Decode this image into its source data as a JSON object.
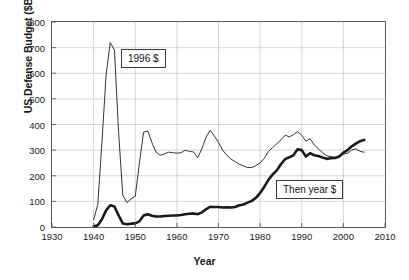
{
  "chart_data": {
    "type": "line",
    "title": "",
    "xlabel": "Year",
    "ylabel": "US Defense Budget ($B)",
    "xlim": [
      1930,
      2010
    ],
    "ylim": [
      0,
      800
    ],
    "xticks": [
      1930,
      1940,
      1950,
      1960,
      1970,
      1980,
      1990,
      2000,
      2010
    ],
    "yticks": [
      0,
      100,
      200,
      300,
      400,
      500,
      600,
      700,
      800
    ],
    "grid": true,
    "legend_position": "inline-annotations",
    "annotations": [
      {
        "text": "1996 $",
        "series": "constant_1996_dollars",
        "x": 1947,
        "y": 640
      },
      {
        "text": "Then year $",
        "series": "then_year_dollars",
        "x": 1985,
        "y": 150
      }
    ],
    "series": [
      {
        "name": "1996 $",
        "style": "thin",
        "color": "#333333",
        "x": [
          1940,
          1941,
          1942,
          1943,
          1944,
          1945,
          1946,
          1947,
          1948,
          1949,
          1950,
          1951,
          1952,
          1953,
          1954,
          1955,
          1956,
          1957,
          1958,
          1959,
          1960,
          1961,
          1962,
          1963,
          1964,
          1965,
          1966,
          1967,
          1968,
          1969,
          1970,
          1971,
          1972,
          1973,
          1974,
          1975,
          1976,
          1977,
          1978,
          1979,
          1980,
          1981,
          1982,
          1983,
          1984,
          1985,
          1986,
          1987,
          1988,
          1989,
          1990,
          1991,
          1992,
          1993,
          1994,
          1995,
          1996,
          1997,
          1998,
          1999,
          2000,
          2001,
          2002,
          2003,
          2004,
          2005
        ],
        "values": [
          28,
          88,
          330,
          595,
          720,
          690,
          370,
          125,
          95,
          110,
          120,
          250,
          370,
          375,
          330,
          292,
          280,
          285,
          292,
          290,
          288,
          290,
          300,
          295,
          293,
          270,
          305,
          350,
          378,
          355,
          330,
          300,
          280,
          265,
          255,
          245,
          238,
          232,
          232,
          240,
          250,
          268,
          295,
          310,
          325,
          340,
          358,
          352,
          360,
          372,
          358,
          335,
          345,
          320,
          305,
          290,
          278,
          275,
          272,
          278,
          285,
          288,
          300,
          305,
          295,
          292
        ]
      },
      {
        "name": "Then year $",
        "style": "thick",
        "color": "#1a1a1a",
        "x": [
          1940,
          1941,
          1942,
          1943,
          1944,
          1945,
          1946,
          1947,
          1948,
          1949,
          1950,
          1951,
          1952,
          1953,
          1954,
          1955,
          1956,
          1957,
          1958,
          1959,
          1960,
          1961,
          1962,
          1963,
          1964,
          1965,
          1966,
          1967,
          1968,
          1969,
          1970,
          1971,
          1972,
          1973,
          1974,
          1975,
          1976,
          1977,
          1978,
          1979,
          1980,
          1981,
          1982,
          1983,
          1984,
          1985,
          1986,
          1987,
          1988,
          1989,
          1990,
          1991,
          1992,
          1993,
          1994,
          1995,
          1996,
          1997,
          1998,
          1999,
          2000,
          2001,
          2002,
          2003,
          2004,
          2005
        ],
        "values": [
          2,
          7,
          30,
          65,
          85,
          80,
          45,
          14,
          11,
          13,
          14,
          22,
          45,
          50,
          44,
          41,
          41,
          43,
          44,
          45,
          45,
          47,
          50,
          52,
          53,
          50,
          57,
          69,
          79,
          78,
          78,
          76,
          77,
          76,
          78,
          85,
          88,
          95,
          102,
          114,
          133,
          157,
          184,
          205,
          221,
          245,
          265,
          272,
          280,
          303,
          300,
          275,
          288,
          280,
          277,
          271,
          266,
          268,
          269,
          275,
          290,
          300,
          315,
          325,
          335,
          340
        ]
      }
    ]
  }
}
